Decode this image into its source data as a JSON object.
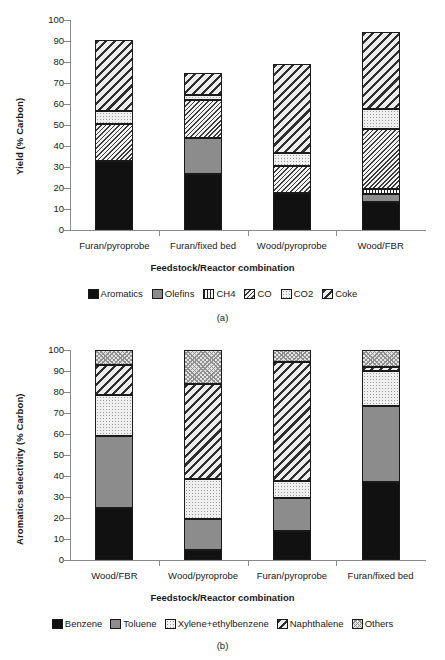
{
  "figure": {
    "panel_a_caption": "(a)",
    "panel_b_caption": "(b)"
  },
  "chart_data": [
    {
      "type": "bar",
      "stacked": true,
      "panel": "a",
      "title": "",
      "xlabel": "Feedstock/Reactor combination",
      "ylabel": "Yield (% Carbon)",
      "ylim": [
        0,
        100
      ],
      "yticks": [
        0,
        10,
        20,
        30,
        40,
        50,
        60,
        70,
        80,
        90,
        100
      ],
      "grid": false,
      "legend_position": "bottom",
      "categories": [
        "Furan/pyroprobe",
        "Furan/fixed bed",
        "Wood/pyroprobe",
        "Wood/FBR"
      ],
      "series": [
        {
          "name": "Aromatics",
          "pattern": "solid-black",
          "values": [
            33.0,
            26.5,
            17.5,
            13.5
          ]
        },
        {
          "name": "Olefins",
          "pattern": "solid-gray",
          "values": [
            0.0,
            17.5,
            0.0,
            3.5
          ]
        },
        {
          "name": "CH4",
          "pattern": "vertical-lines",
          "values": [
            0.0,
            0.0,
            0.0,
            2.5
          ]
        },
        {
          "name": "CO",
          "pattern": "dense-diagonal",
          "values": [
            17.5,
            18.0,
            13.0,
            28.5
          ]
        },
        {
          "name": "CO2",
          "pattern": "light-dots",
          "values": [
            6.0,
            2.5,
            6.0,
            9.5
          ]
        },
        {
          "name": "Coke",
          "pattern": "wide-diagonal",
          "values": [
            34.0,
            10.5,
            42.5,
            37.0
          ]
        }
      ],
      "totals": [
        90.5,
        75.0,
        79.0,
        94.5
      ]
    },
    {
      "type": "bar",
      "stacked": true,
      "panel": "b",
      "title": "",
      "xlabel": "Feedstock/Reactor combination",
      "ylabel": "Aromatics selectivity (% Carbon)",
      "ylim": [
        0,
        100
      ],
      "yticks": [
        0,
        10,
        20,
        30,
        40,
        50,
        60,
        70,
        80,
        90,
        100
      ],
      "grid": false,
      "legend_position": "bottom",
      "categories": [
        "Wood/FBR",
        "Wood/pyroprobe",
        "Furan/pyroprobe",
        "Furan/fixed bed"
      ],
      "series": [
        {
          "name": "Benzene",
          "pattern": "solid-black",
          "values": [
            25.0,
            5.0,
            14.0,
            37.0
          ]
        },
        {
          "name": "Toluene",
          "pattern": "solid-gray",
          "values": [
            34.0,
            14.5,
            15.5,
            36.5
          ]
        },
        {
          "name": "Xylene+ethylbenzene",
          "pattern": "light-dots",
          "values": [
            19.5,
            19.0,
            8.0,
            16.5
          ]
        },
        {
          "name": "Naphthalene",
          "pattern": "wide-diagonal",
          "values": [
            14.5,
            45.5,
            57.0,
            2.0
          ]
        },
        {
          "name": "Others",
          "pattern": "cross-hatch",
          "values": [
            7.0,
            16.0,
            5.5,
            8.0
          ]
        }
      ],
      "totals": [
        100,
        100,
        100,
        100
      ]
    }
  ]
}
